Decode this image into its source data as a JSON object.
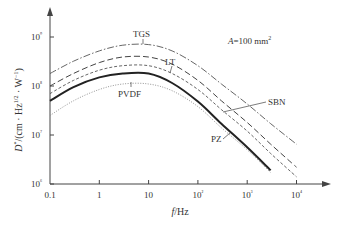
{
  "chart_data": {
    "type": "line",
    "title": "",
    "annotation": "A = 100 mm²",
    "xlabel": "f/Hz",
    "ylabel": "D*/(cm·Hz^1/2·W^-1)",
    "xscale": "log",
    "yscale": "log",
    "xlim": [
      0.1,
      20000
    ],
    "ylim": [
      1000000,
      1000000000
    ],
    "x_ticks": [
      "0.1",
      "1",
      "10",
      "10²",
      "10³",
      "10⁴"
    ],
    "y_ticks": [
      "10⁶",
      "10⁷",
      "10⁸",
      "10⁹"
    ],
    "x": [
      0.1,
      0.3,
      1,
      3,
      10,
      30,
      100,
      300,
      1000,
      3000,
      10000
    ],
    "series": [
      {
        "name": "TGS",
        "style": "dash-dot",
        "values": [
          180000000.0,
          320000000.0,
          520000000.0,
          680000000.0,
          700000000.0,
          520000000.0,
          260000000.0,
          110000000.0,
          43000000.0,
          17000000.0,
          6500000.0
        ]
      },
      {
        "name": "LT",
        "style": "long-dash",
        "values": [
          100000000.0,
          180000000.0,
          300000000.0,
          390000000.0,
          390000000.0,
          280000000.0,
          130000000.0,
          50000000.0,
          18000000.0,
          6500000.0,
          2200000.0
        ]
      },
      {
        "name": "SBN",
        "style": "short-dash",
        "values": [
          70000000.0,
          130000000.0,
          210000000.0,
          260000000.0,
          260000000.0,
          180000000.0,
          85000000.0,
          33000000.0,
          12000000.0,
          4200000.0,
          1400000.0
        ]
      },
      {
        "name": "PZ",
        "style": "solid",
        "values": [
          50000000.0,
          95000000.0,
          150000000.0,
          180000000.0,
          180000000.0,
          115000000.0,
          48000000.0,
          17000000.0,
          5600000.0,
          1900000.0,
          600000.0
        ]
      },
      {
        "name": "PVDF",
        "style": "dotted",
        "values": [
          25000000.0,
          50000000.0,
          85000000.0,
          110000000.0,
          110000000.0,
          80000000.0,
          38000000.0,
          14000000.0,
          5000000.0,
          1700000.0,
          600000.0
        ]
      }
    ],
    "grid": false,
    "legend": "inline labels"
  },
  "labels": {
    "TGS": "TGS",
    "LT": "LT",
    "SBN": "SBN",
    "PZ": "PZ",
    "PVDF": "PVDF",
    "annotation": "A=100 mm²",
    "xlabel": "f/Hz",
    "ylabel": "D*/(cm · Hz^1/2 · W^-1)"
  }
}
